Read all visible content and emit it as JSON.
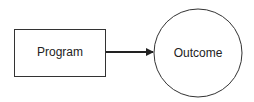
{
  "diagram": {
    "nodes": [
      {
        "id": "program",
        "shape": "rectangle",
        "label": "Program"
      },
      {
        "id": "outcome",
        "shape": "circle",
        "label": "Outcome"
      }
    ],
    "edges": [
      {
        "from": "program",
        "to": "outcome",
        "style": "arrow"
      }
    ],
    "colors": {
      "stroke": "#222222",
      "background": "#ffffff"
    }
  }
}
